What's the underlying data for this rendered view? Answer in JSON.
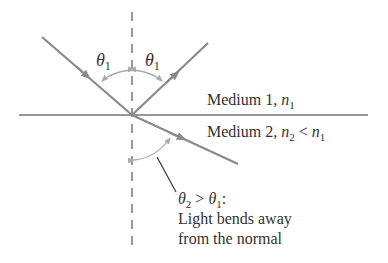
{
  "diagram": {
    "type": "optics-refraction-reflection",
    "colors": {
      "ray": "#8a8a8a",
      "boundary": "#333333",
      "normal": "#555555",
      "angle_arc": "#aaaaaa",
      "text": "#333333"
    },
    "labels": {
      "theta_symbol": "θ",
      "theta_sub_1": "1",
      "theta_sub_2": "2",
      "medium1_text": "Medium 1, ",
      "medium1_n": "n",
      "medium1_n_sub": "1",
      "medium2_text": "Medium 2, ",
      "medium2_n": "n",
      "medium2_n_sub": "2",
      "medium2_lt": " < ",
      "medium2_n_rhs": "n",
      "medium2_n_rhs_sub": "1",
      "annotation_gt": " > ",
      "annotation_colon": ":",
      "annotation_line2": "Light bends away",
      "annotation_line3": "from the normal"
    }
  }
}
